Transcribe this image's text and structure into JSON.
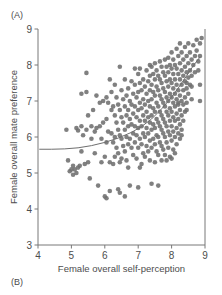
{
  "figure": {
    "panel_a_label": "(A)",
    "panel_b_label": "(B)"
  },
  "chart_data": {
    "type": "scatter",
    "title": "",
    "xlabel": "Female overall self-perception",
    "ylabel": "Female overall mate preference",
    "xlim": [
      4,
      9
    ],
    "ylim": [
      3,
      9
    ],
    "xticks": [
      4,
      5,
      6,
      7,
      8,
      9
    ],
    "yticks": [
      3,
      4,
      5,
      6,
      7,
      8,
      9
    ],
    "xtick_labels": [
      "4",
      "5",
      "6",
      "7",
      "8",
      "9"
    ],
    "ytick_labels": [
      "3",
      "4",
      "5",
      "6",
      "7",
      "8",
      "9"
    ],
    "grid": false,
    "legend": null,
    "marker": {
      "shape": "circle",
      "color": "#6e6e6e",
      "size_px": 4.6,
      "opacity": 0.88
    },
    "trend_line": {
      "kind": "fitted-curve",
      "color": "#6e6e6e",
      "width_px": 1.0,
      "points": [
        [
          4.05,
          5.66
        ],
        [
          4.4,
          5.66
        ],
        [
          4.8,
          5.67
        ],
        [
          5.2,
          5.7
        ],
        [
          5.6,
          5.76
        ],
        [
          6.0,
          5.85
        ],
        [
          6.4,
          5.97
        ],
        [
          6.8,
          6.13
        ],
        [
          7.1,
          6.29
        ],
        [
          7.4,
          6.5
        ],
        [
          7.7,
          6.78
        ],
        [
          7.95,
          7.05
        ],
        [
          8.2,
          7.36
        ],
        [
          8.45,
          7.7
        ],
        [
          8.65,
          7.98
        ],
        [
          8.85,
          8.22
        ]
      ]
    },
    "points": [
      [
        4.85,
        6.2
      ],
      [
        4.9,
        5.35
      ],
      [
        4.95,
        5.05
      ],
      [
        5.0,
        5.1
      ],
      [
        5.05,
        4.95
      ],
      [
        5.05,
        5.2
      ],
      [
        5.1,
        5.1
      ],
      [
        5.15,
        6.25
      ],
      [
        5.15,
        5.0
      ],
      [
        5.2,
        5.15
      ],
      [
        5.2,
        6.18
      ],
      [
        5.25,
        5.2
      ],
      [
        5.3,
        7.2
      ],
      [
        5.3,
        6.3
      ],
      [
        5.3,
        5.6
      ],
      [
        5.35,
        6.05
      ],
      [
        5.4,
        5.25
      ],
      [
        5.45,
        7.78
      ],
      [
        5.45,
        6.2
      ],
      [
        5.5,
        6.6
      ],
      [
        5.5,
        5.3
      ],
      [
        5.55,
        4.85
      ],
      [
        5.6,
        6.3
      ],
      [
        5.6,
        5.95
      ],
      [
        5.65,
        6.75
      ],
      [
        5.7,
        6.15
      ],
      [
        5.7,
        5.55
      ],
      [
        5.75,
        6.25
      ],
      [
        5.8,
        4.65
      ],
      [
        5.85,
        6.95
      ],
      [
        5.85,
        6.3
      ],
      [
        5.9,
        5.3
      ],
      [
        5.9,
        5.95
      ],
      [
        5.95,
        7.0
      ],
      [
        5.95,
        6.4
      ],
      [
        6.0,
        5.45
      ],
      [
        6.0,
        4.35
      ],
      [
        6.05,
        7.1
      ],
      [
        6.05,
        6.5
      ],
      [
        6.05,
        5.85
      ],
      [
        6.1,
        6.95
      ],
      [
        6.1,
        6.15
      ],
      [
        6.15,
        5.3
      ],
      [
        6.15,
        4.5
      ],
      [
        6.2,
        7.25
      ],
      [
        6.2,
        6.75
      ],
      [
        6.2,
        6.1
      ],
      [
        6.25,
        6.85
      ],
      [
        6.25,
        5.85
      ],
      [
        6.25,
        5.25
      ],
      [
        6.3,
        7.45
      ],
      [
        6.3,
        6.6
      ],
      [
        6.3,
        6.0
      ],
      [
        6.3,
        5.45
      ],
      [
        6.35,
        7.1
      ],
      [
        6.35,
        6.4
      ],
      [
        6.35,
        5.7
      ],
      [
        6.4,
        6.9
      ],
      [
        6.4,
        6.2
      ],
      [
        6.4,
        5.55
      ],
      [
        6.4,
        4.55
      ],
      [
        6.45,
        7.95
      ],
      [
        6.45,
        6.75
      ],
      [
        6.45,
        6.05
      ],
      [
        6.45,
        5.3
      ],
      [
        6.5,
        7.3
      ],
      [
        6.5,
        6.55
      ],
      [
        6.5,
        5.95
      ],
      [
        6.5,
        5.4
      ],
      [
        6.55,
        7.05
      ],
      [
        6.55,
        6.4
      ],
      [
        6.55,
        5.75
      ],
      [
        6.6,
        7.6
      ],
      [
        6.6,
        6.85
      ],
      [
        6.6,
        6.2
      ],
      [
        6.6,
        5.6
      ],
      [
        6.65,
        7.15
      ],
      [
        6.65,
        6.6
      ],
      [
        6.65,
        6.0
      ],
      [
        6.65,
        5.35
      ],
      [
        6.7,
        7.35
      ],
      [
        6.7,
        6.75
      ],
      [
        6.7,
        6.3
      ],
      [
        6.7,
        5.8
      ],
      [
        6.7,
        5.15
      ],
      [
        6.75,
        7.0
      ],
      [
        6.75,
        6.5
      ],
      [
        6.75,
        5.95
      ],
      [
        6.75,
        4.65
      ],
      [
        6.8,
        7.55
      ],
      [
        6.8,
        6.9
      ],
      [
        6.8,
        6.35
      ],
      [
        6.8,
        5.7
      ],
      [
        6.85,
        7.2
      ],
      [
        6.85,
        6.65
      ],
      [
        6.85,
        6.1
      ],
      [
        6.85,
        5.5
      ],
      [
        6.9,
        7.45
      ],
      [
        6.9,
        6.85
      ],
      [
        6.9,
        6.3
      ],
      [
        6.9,
        5.85
      ],
      [
        6.95,
        7.1
      ],
      [
        6.95,
        6.55
      ],
      [
        6.95,
        6.05
      ],
      [
        6.95,
        5.4
      ],
      [
        7.0,
        7.75
      ],
      [
        7.0,
        7.25
      ],
      [
        7.0,
        6.75
      ],
      [
        7.0,
        6.25
      ],
      [
        7.0,
        5.7
      ],
      [
        7.0,
        4.6
      ],
      [
        7.05,
        7.5
      ],
      [
        7.05,
        6.95
      ],
      [
        7.05,
        6.45
      ],
      [
        7.05,
        5.95
      ],
      [
        7.1,
        7.3
      ],
      [
        7.1,
        6.8
      ],
      [
        7.1,
        6.3
      ],
      [
        7.1,
        5.8
      ],
      [
        7.1,
        5.25
      ],
      [
        7.15,
        7.6
      ],
      [
        7.15,
        7.05
      ],
      [
        7.15,
        6.6
      ],
      [
        7.15,
        6.1
      ],
      [
        7.15,
        5.55
      ],
      [
        7.2,
        7.4
      ],
      [
        7.2,
        6.9
      ],
      [
        7.2,
        6.45
      ],
      [
        7.2,
        6.0
      ],
      [
        7.2,
        5.45
      ],
      [
        7.25,
        7.85
      ],
      [
        7.25,
        7.2
      ],
      [
        7.25,
        6.7
      ],
      [
        7.25,
        6.25
      ],
      [
        7.25,
        5.75
      ],
      [
        7.3,
        7.55
      ],
      [
        7.3,
        7.0
      ],
      [
        7.3,
        6.55
      ],
      [
        7.3,
        6.1
      ],
      [
        7.3,
        5.6
      ],
      [
        7.35,
        7.7
      ],
      [
        7.35,
        7.3
      ],
      [
        7.35,
        6.85
      ],
      [
        7.35,
        6.4
      ],
      [
        7.35,
        5.9
      ],
      [
        7.35,
        5.35
      ],
      [
        7.4,
        7.95
      ],
      [
        7.4,
        7.45
      ],
      [
        7.4,
        7.05
      ],
      [
        7.4,
        6.6
      ],
      [
        7.4,
        6.2
      ],
      [
        7.4,
        5.7
      ],
      [
        7.45,
        7.75
      ],
      [
        7.45,
        7.25
      ],
      [
        7.45,
        6.8
      ],
      [
        7.45,
        6.35
      ],
      [
        7.45,
        5.95
      ],
      [
        7.5,
        8.05
      ],
      [
        7.5,
        7.6
      ],
      [
        7.5,
        7.15
      ],
      [
        7.5,
        6.7
      ],
      [
        7.5,
        6.25
      ],
      [
        7.5,
        5.8
      ],
      [
        7.5,
        5.3
      ],
      [
        7.55,
        7.85
      ],
      [
        7.55,
        7.4
      ],
      [
        7.55,
        6.95
      ],
      [
        7.55,
        6.5
      ],
      [
        7.55,
        6.05
      ],
      [
        7.55,
        5.6
      ],
      [
        7.6,
        7.7
      ],
      [
        7.6,
        7.3
      ],
      [
        7.6,
        6.85
      ],
      [
        7.6,
        6.4
      ],
      [
        7.6,
        6.0
      ],
      [
        7.6,
        5.5
      ],
      [
        7.65,
        8.1
      ],
      [
        7.65,
        7.6
      ],
      [
        7.65,
        7.15
      ],
      [
        7.65,
        6.7
      ],
      [
        7.65,
        6.3
      ],
      [
        7.65,
        5.85
      ],
      [
        7.7,
        7.95
      ],
      [
        7.7,
        7.5
      ],
      [
        7.7,
        7.05
      ],
      [
        7.7,
        6.6
      ],
      [
        7.7,
        6.2
      ],
      [
        7.7,
        5.75
      ],
      [
        7.7,
        5.35
      ],
      [
        7.75,
        7.8
      ],
      [
        7.75,
        7.35
      ],
      [
        7.75,
        6.95
      ],
      [
        7.75,
        6.5
      ],
      [
        7.75,
        6.1
      ],
      [
        7.75,
        5.65
      ],
      [
        7.8,
        8.15
      ],
      [
        7.8,
        7.7
      ],
      [
        7.8,
        7.25
      ],
      [
        7.8,
        6.85
      ],
      [
        7.8,
        6.4
      ],
      [
        7.8,
        6.0
      ],
      [
        7.8,
        5.5
      ],
      [
        7.85,
        7.95
      ],
      [
        7.85,
        7.55
      ],
      [
        7.85,
        7.1
      ],
      [
        7.85,
        6.7
      ],
      [
        7.85,
        6.3
      ],
      [
        7.85,
        5.85
      ],
      [
        7.9,
        8.2
      ],
      [
        7.9,
        7.8
      ],
      [
        7.9,
        7.4
      ],
      [
        7.9,
        7.0
      ],
      [
        7.9,
        6.6
      ],
      [
        7.9,
        6.15
      ],
      [
        7.9,
        5.7
      ],
      [
        7.95,
        8.0
      ],
      [
        7.95,
        7.6
      ],
      [
        7.95,
        7.2
      ],
      [
        7.95,
        6.8
      ],
      [
        7.95,
        6.45
      ],
      [
        7.95,
        6.05
      ],
      [
        7.95,
        5.45
      ],
      [
        8.0,
        8.35
      ],
      [
        8.0,
        7.9
      ],
      [
        8.0,
        7.5
      ],
      [
        8.0,
        7.1
      ],
      [
        8.0,
        6.7
      ],
      [
        8.0,
        6.3
      ],
      [
        8.0,
        5.9
      ],
      [
        8.0,
        5.4
      ],
      [
        8.05,
        8.15
      ],
      [
        8.05,
        7.75
      ],
      [
        8.05,
        7.35
      ],
      [
        8.05,
        6.95
      ],
      [
        8.05,
        6.55
      ],
      [
        8.05,
        6.15
      ],
      [
        8.05,
        5.65
      ],
      [
        8.1,
        8.0
      ],
      [
        8.1,
        7.6
      ],
      [
        8.1,
        7.2
      ],
      [
        8.1,
        6.85
      ],
      [
        8.1,
        6.45
      ],
      [
        8.1,
        6.0
      ],
      [
        8.15,
        8.45
      ],
      [
        8.15,
        7.9
      ],
      [
        8.15,
        7.45
      ],
      [
        8.15,
        7.05
      ],
      [
        8.15,
        6.65
      ],
      [
        8.15,
        6.25
      ],
      [
        8.15,
        5.8
      ],
      [
        8.2,
        8.25
      ],
      [
        8.2,
        7.75
      ],
      [
        8.2,
        7.3
      ],
      [
        8.2,
        6.9
      ],
      [
        8.2,
        6.5
      ],
      [
        8.2,
        6.1
      ],
      [
        8.25,
        8.6
      ],
      [
        8.25,
        8.05
      ],
      [
        8.25,
        7.6
      ],
      [
        8.25,
        7.15
      ],
      [
        8.25,
        6.75
      ],
      [
        8.25,
        6.35
      ],
      [
        8.25,
        5.95
      ],
      [
        8.3,
        8.35
      ],
      [
        8.3,
        7.85
      ],
      [
        8.3,
        7.45
      ],
      [
        8.3,
        7.0
      ],
      [
        8.3,
        6.6
      ],
      [
        8.3,
        6.2
      ],
      [
        8.35,
        8.15
      ],
      [
        8.35,
        7.7
      ],
      [
        8.35,
        7.3
      ],
      [
        8.35,
        6.9
      ],
      [
        8.35,
        6.45
      ],
      [
        8.4,
        8.5
      ],
      [
        8.4,
        7.95
      ],
      [
        8.4,
        7.55
      ],
      [
        8.4,
        7.1
      ],
      [
        8.4,
        6.7
      ],
      [
        8.45,
        8.25
      ],
      [
        8.45,
        7.8
      ],
      [
        8.45,
        7.35
      ],
      [
        8.45,
        6.95
      ],
      [
        8.45,
        7.5
      ],
      [
        8.5,
        8.6
      ],
      [
        8.5,
        8.05
      ],
      [
        8.5,
        7.65
      ],
      [
        8.5,
        7.2
      ],
      [
        8.55,
        8.35
      ],
      [
        8.55,
        7.85
      ],
      [
        8.55,
        7.45
      ],
      [
        8.6,
        8.15
      ],
      [
        8.6,
        7.7
      ],
      [
        8.6,
        7.4
      ],
      [
        8.65,
        8.55
      ],
      [
        8.65,
        8.0
      ],
      [
        8.7,
        8.25
      ],
      [
        8.7,
        7.8
      ],
      [
        8.75,
        8.7
      ],
      [
        8.75,
        8.4
      ],
      [
        8.8,
        8.1
      ],
      [
        8.8,
        7.85
      ],
      [
        8.85,
        8.6
      ],
      [
        8.85,
        8.25
      ],
      [
        8.85,
        7.45
      ],
      [
        8.9,
        8.75
      ],
      [
        8.85,
        7.0
      ],
      [
        8.6,
        7.05
      ],
      [
        8.3,
        6.05
      ],
      [
        8.1,
        5.55
      ],
      [
        7.85,
        5.35
      ],
      [
        7.6,
        4.65
      ],
      [
        7.4,
        4.7
      ],
      [
        7.05,
        5.15
      ],
      [
        6.6,
        4.35
      ],
      [
        6.45,
        4.45
      ],
      [
        6.05,
        4.3
      ],
      [
        5.45,
        7.25
      ],
      [
        5.75,
        7.15
      ],
      [
        6.15,
        7.6
      ],
      [
        6.9,
        7.9
      ],
      [
        7.35,
        8.0
      ],
      [
        7.05,
        7.9
      ],
      [
        8.45,
        6.75
      ],
      [
        8.2,
        6.95
      ]
    ]
  }
}
